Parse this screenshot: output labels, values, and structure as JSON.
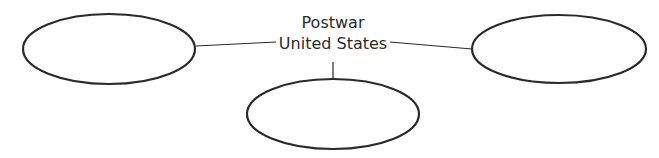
{
  "diagram": {
    "type": "concept-web",
    "center": {
      "line1": "Postwar",
      "line2": "United States"
    },
    "nodes": [
      {
        "id": "left",
        "label": ""
      },
      {
        "id": "right",
        "label": ""
      },
      {
        "id": "bottom",
        "label": ""
      }
    ],
    "colors": {
      "stroke": "#2a2a2a",
      "text": "#2b2b2b",
      "background": "#ffffff"
    }
  }
}
